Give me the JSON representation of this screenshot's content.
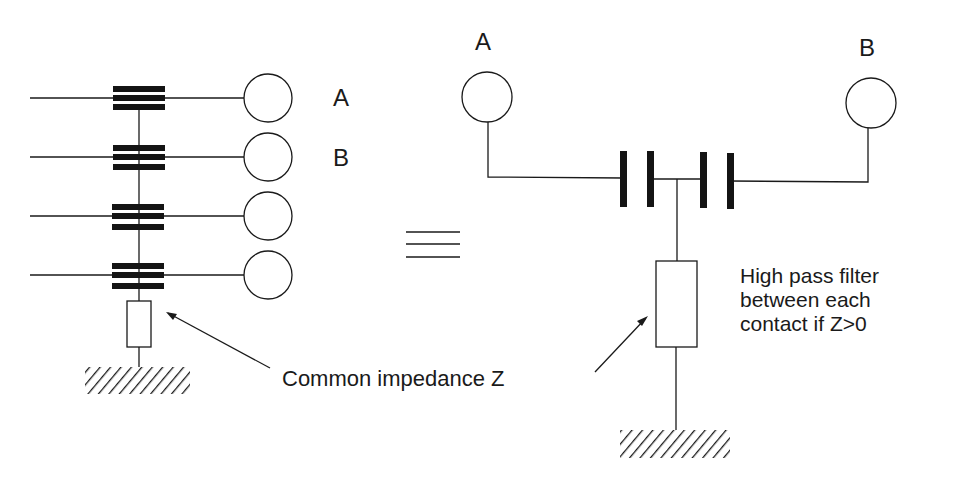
{
  "diagram": {
    "left": {
      "label_a": "A",
      "label_b": "B",
      "contacts": 4,
      "common_impedance_label": "Common impedance Z"
    },
    "equivalence_symbol": "≡",
    "right": {
      "label_a": "A",
      "label_b": "B",
      "note_lines": [
        "High pass filter",
        "between each",
        "contact if Z>0"
      ]
    },
    "colors": {
      "ink": "#1a1a1a",
      "background": "#ffffff"
    }
  }
}
